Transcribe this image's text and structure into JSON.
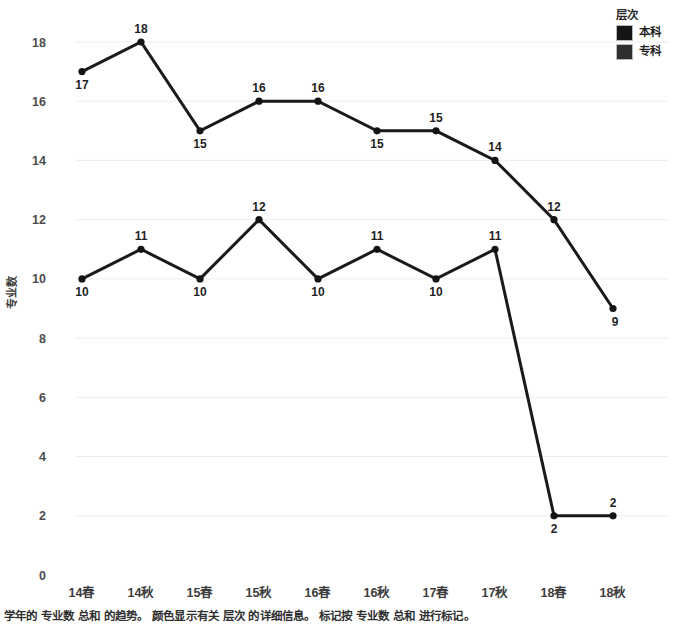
{
  "chart_data": {
    "type": "line",
    "title": "",
    "xlabel": "",
    "ylabel": "专业数",
    "ylim": [
      0,
      18
    ],
    "ytick_step": 2,
    "yticks": [
      "0",
      "2",
      "4",
      "6",
      "8",
      "10",
      "12",
      "14",
      "16",
      "18"
    ],
    "grid": true,
    "legend_position": "top-right",
    "categories": [
      "14春",
      "14秋",
      "15春",
      "15秋",
      "16春",
      "16秋",
      "17春",
      "17秋",
      "18春",
      "18秋"
    ],
    "series": [
      {
        "name": "本科",
        "color": "#151515",
        "values": [
          17,
          18,
          15,
          16,
          16,
          15,
          15,
          14,
          12,
          9
        ],
        "label_offsets": [
          "below",
          "above",
          "below",
          "above",
          "above",
          "below",
          "above",
          "above",
          "above",
          "below"
        ]
      },
      {
        "name": "专科",
        "color": "#2e2e2e",
        "values": [
          10,
          11,
          10,
          12,
          10,
          11,
          10,
          11,
          2,
          2
        ],
        "label_offsets": [
          "below",
          "above",
          "below",
          "above",
          "below",
          "above",
          "below",
          "above",
          "below",
          "above"
        ]
      }
    ]
  },
  "legend": {
    "title": "层次",
    "items": [
      {
        "label": "本科",
        "color": "#151515"
      },
      {
        "label": "专科",
        "color": "#2e2e2e"
      }
    ]
  },
  "caption": {
    "text": "学年的 专业数 总和 的趋势。 颜色显示有关 层次 的详细信息。 标记按 专业数 总和 进行标记。"
  }
}
